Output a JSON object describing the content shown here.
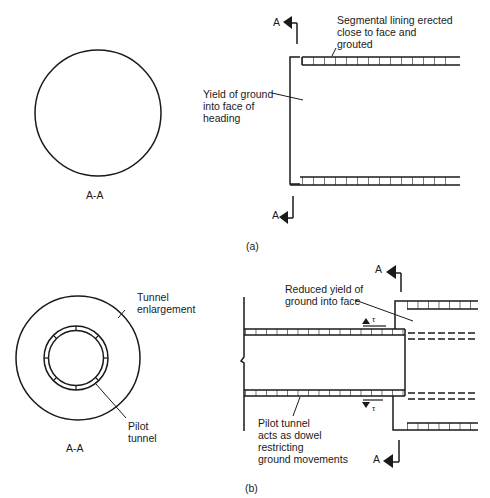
{
  "figure_a": {
    "section_label": "A-A",
    "section_marker": "A",
    "caption": "(a)",
    "annotations": {
      "lining": "Segmental lining erected\nclose to face and\ngrouted",
      "yield": "Yield of ground\ninto face of\nheading"
    }
  },
  "figure_b": {
    "section_label": "A-A",
    "section_marker": "A",
    "caption": "(b)",
    "shear_symbol": "τ",
    "annotations": {
      "enlargement": "Tunnel\nenlargement",
      "pilot": "Pilot\ntunnel",
      "reduced_yield": "Reduced yield of\nground into face",
      "dowel": "Pilot tunnel\nacts as dowel\nrestricting\nground movements"
    }
  },
  "colors": {
    "line": "#1a1a1a",
    "background": "#ffffff"
  }
}
